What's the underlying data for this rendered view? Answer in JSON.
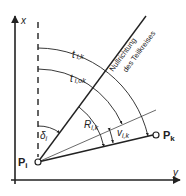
{
  "diagram": {
    "axes": {
      "x_label": "x",
      "y_label": "y"
    },
    "points": {
      "origin": {
        "label": "P",
        "subscript": "i"
      },
      "target": {
        "label": "P",
        "subscript": "k"
      }
    },
    "lines": {
      "null_direction": {
        "label_line1": "Nullrichtung",
        "label_line2": "des Teilkreises"
      }
    },
    "angles": {
      "t_ik": {
        "symbol": "t",
        "subscript": "i,k"
      },
      "t_iok": {
        "symbol": "t",
        "subscript": "i,ok"
      },
      "delta_i": {
        "symbol": "δ",
        "subscript": "i"
      },
      "R_ik": {
        "symbol": "R",
        "subscript": "i,k"
      },
      "v_ik": {
        "symbol": "v",
        "subscript": "i,k"
      }
    },
    "colors": {
      "ink": "#222222",
      "background": "#ffffff"
    }
  }
}
